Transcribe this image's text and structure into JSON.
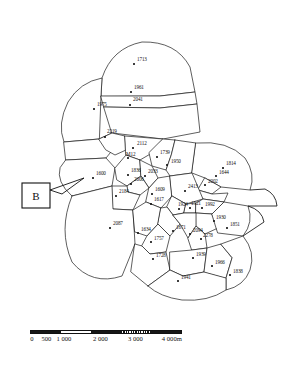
{
  "figure": {
    "type": "thiessen-polygon-map",
    "callout": {
      "label": "B",
      "name": "region-b-callout"
    }
  },
  "scale_bar": {
    "unit_suffix": "m",
    "ticks": [
      {
        "label": "0",
        "pos_pct": 0
      },
      {
        "label": "500",
        "pos_pct": 9.5
      },
      {
        "label": "1 000",
        "pos_pct": 21
      },
      {
        "label": "2 000",
        "pos_pct": 45
      },
      {
        "label": "3 000",
        "pos_pct": 68
      },
      {
        "label": "4 000m",
        "pos_pct": 92
      }
    ],
    "segments": [
      {
        "style": "dark"
      },
      {
        "style": "light"
      },
      {
        "style": "dark"
      },
      {
        "style": "hatch"
      },
      {
        "style": "dark"
      }
    ]
  },
  "points": [
    {
      "id": "p01",
      "label": "1713",
      "x": 134,
      "y": 64,
      "lx": 137,
      "ly": 61
    },
    {
      "id": "p02",
      "label": "1961",
      "x": 131,
      "y": 92,
      "lx": 134,
      "ly": 89
    },
    {
      "id": "p03",
      "label": "2041",
      "x": 130,
      "y": 105,
      "lx": 133,
      "ly": 101
    },
    {
      "id": "p04",
      "label": "1975",
      "x": 94,
      "y": 109,
      "lx": 97,
      "ly": 106
    },
    {
      "id": "p05",
      "label": "2219",
      "x": 105,
      "y": 137,
      "lx": 107,
      "ly": 133
    },
    {
      "id": "p06",
      "label": "2112",
      "x": 133,
      "y": 148,
      "lx": 137,
      "ly": 145
    },
    {
      "id": "p07",
      "label": "M12",
      "x": 128,
      "y": 158,
      "lx": 126,
      "ly": 156
    },
    {
      "id": "p08",
      "label": "1739",
      "x": 157,
      "y": 157,
      "lx": 160,
      "ly": 154
    },
    {
      "id": "p09",
      "label": "1950",
      "x": 167,
      "y": 165,
      "lx": 171,
      "ly": 163
    },
    {
      "id": "p10",
      "label": "1814",
      "x": 223,
      "y": 168,
      "lx": 226,
      "ly": 165
    },
    {
      "id": "p11",
      "label": "1644",
      "x": 216,
      "y": 176,
      "lx": 219,
      "ly": 174
    },
    {
      "id": "p12",
      "label": "1600",
      "x": 93,
      "y": 178,
      "lx": 96,
      "ly": 175
    },
    {
      "id": "p13",
      "label": "1836",
      "x": 128,
      "y": 175,
      "lx": 131,
      "ly": 172
    },
    {
      "id": "p14",
      "label": "2033",
      "x": 145,
      "y": 176,
      "lx": 148,
      "ly": 173
    },
    {
      "id": "p15",
      "label": "2006",
      "x": 131,
      "y": 184,
      "lx": 134,
      "ly": 181
    },
    {
      "id": "p16",
      "label": "2002",
      "x": 205,
      "y": 185,
      "lx": 208,
      "ly": 183
    },
    {
      "id": "p17",
      "label": "2184",
      "x": 116,
      "y": 196,
      "lx": 119,
      "ly": 193
    },
    {
      "id": "p18",
      "label": "1609",
      "x": 152,
      "y": 194,
      "lx": 155,
      "ly": 191
    },
    {
      "id": "p19",
      "label": "2413",
      "x": 185,
      "y": 191,
      "lx": 188,
      "ly": 188
    },
    {
      "id": "p20",
      "label": "1617",
      "x": 151,
      "y": 204,
      "lx": 154,
      "ly": 201
    },
    {
      "id": "p21",
      "label": "1924",
      "x": 179,
      "y": 209,
      "lx": 178,
      "ly": 206
    },
    {
      "id": "p22",
      "label": "1521",
      "x": 190,
      "y": 208,
      "lx": 191,
      "ly": 205
    },
    {
      "id": "p23",
      "label": "1992",
      "x": 202,
      "y": 208,
      "lx": 205,
      "ly": 206
    },
    {
      "id": "p24",
      "label": "1930",
      "x": 214,
      "y": 221,
      "lx": 216,
      "ly": 219
    },
    {
      "id": "p25",
      "label": "1851",
      "x": 227,
      "y": 228,
      "lx": 230,
      "ly": 226
    },
    {
      "id": "p26",
      "label": "2087",
      "x": 110,
      "y": 228,
      "lx": 113,
      "ly": 225
    },
    {
      "id": "p27",
      "label": "1634",
      "x": 138,
      "y": 233,
      "lx": 141,
      "ly": 231
    },
    {
      "id": "p28",
      "label": "1671",
      "x": 173,
      "y": 231,
      "lx": 176,
      "ly": 229
    },
    {
      "id": "p29",
      "label": "2094",
      "x": 190,
      "y": 234,
      "lx": 193,
      "ly": 232
    },
    {
      "id": "p30",
      "label": "1757",
      "x": 151,
      "y": 242,
      "lx": 154,
      "ly": 240
    },
    {
      "id": "p31",
      "label": "2278",
      "x": 201,
      "y": 239,
      "lx": 203,
      "ly": 237
    },
    {
      "id": "p32",
      "label": "1728",
      "x": 153,
      "y": 259,
      "lx": 156,
      "ly": 257
    },
    {
      "id": "p33",
      "label": "1939",
      "x": 193,
      "y": 258,
      "lx": 196,
      "ly": 256
    },
    {
      "id": "p34",
      "label": "1966",
      "x": 212,
      "y": 266,
      "lx": 215,
      "ly": 264
    },
    {
      "id": "p35",
      "label": "1838",
      "x": 230,
      "y": 275,
      "lx": 233,
      "ly": 273
    },
    {
      "id": "p36",
      "label": "1941",
      "x": 178,
      "y": 281,
      "lx": 181,
      "ly": 279
    }
  ],
  "colors": {
    "ink": "#111111",
    "paper": "#ffffff"
  }
}
